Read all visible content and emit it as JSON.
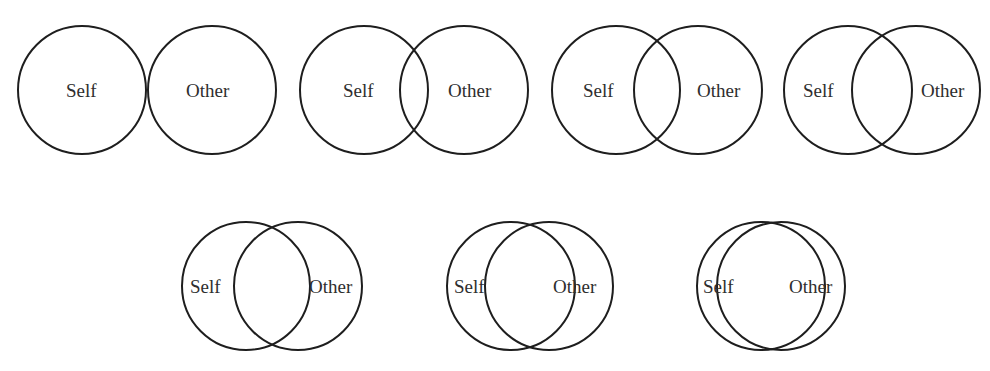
{
  "diagram": {
    "stroke_color": "#1e1e1e",
    "text_color": "#2e2e2e",
    "circle_diameter": 130,
    "label_self": "Self",
    "label_other": "Other",
    "pairs": [
      {
        "index": 1,
        "row": 1,
        "self_label": "Self",
        "other_label": "Other",
        "self_center": [
          82,
          90
        ],
        "other_center": [
          212,
          90
        ],
        "self_label_x": 66,
        "other_label_x": 186,
        "label_y": 90
      },
      {
        "index": 2,
        "row": 1,
        "self_label": "Self",
        "other_label": "Other",
        "self_center": [
          364,
          90
        ],
        "other_center": [
          464,
          90
        ],
        "self_label_x": 343,
        "other_label_x": 448,
        "label_y": 90
      },
      {
        "index": 3,
        "row": 1,
        "self_label": "Self",
        "other_label": "Other",
        "self_center": [
          616,
          90
        ],
        "other_center": [
          698,
          90
        ],
        "self_label_x": 583,
        "other_label_x": 697,
        "label_y": 90
      },
      {
        "index": 4,
        "row": 1,
        "self_label": "Self",
        "other_label": "Other",
        "self_center": [
          848,
          90
        ],
        "other_center": [
          916,
          90
        ],
        "self_label_x": 803,
        "other_label_x": 921,
        "label_y": 90
      },
      {
        "index": 5,
        "row": 2,
        "self_label": "Self",
        "other_label": "Other",
        "self_center": [
          246,
          286
        ],
        "other_center": [
          298,
          286
        ],
        "self_label_x": 190,
        "other_label_x": 309,
        "label_y": 286
      },
      {
        "index": 6,
        "row": 2,
        "self_label": "Self",
        "other_label": "Other",
        "self_center": [
          511,
          286
        ],
        "other_center": [
          549,
          286
        ],
        "self_label_x": 454,
        "other_label_x": 553,
        "label_y": 286
      },
      {
        "index": 7,
        "row": 2,
        "self_label": "Self",
        "other_label": "Other",
        "self_center": [
          761,
          286
        ],
        "other_center": [
          781,
          286
        ],
        "self_label_x": 703,
        "other_label_x": 789,
        "label_y": 286
      }
    ]
  }
}
